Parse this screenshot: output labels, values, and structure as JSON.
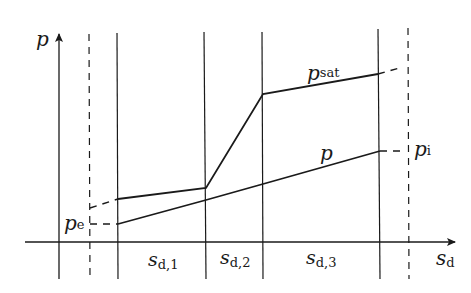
{
  "diagram": {
    "type": "pressure-profile",
    "axes": {
      "y_label": "p",
      "x_label": "s",
      "x_label_sub": "d"
    },
    "curves": {
      "saturation": {
        "label": "p",
        "label_sub": "sat"
      },
      "partial": {
        "label": "p"
      }
    },
    "boundary_labels": {
      "exterior": {
        "label": "p",
        "label_sub": "e"
      },
      "interior": {
        "label": "p",
        "label_sub": "i"
      }
    },
    "layers": [
      {
        "label": "s",
        "label_sub": "d,1"
      },
      {
        "label": "s",
        "label_sub": "d,2"
      },
      {
        "label": "s",
        "label_sub": "d,3"
      }
    ],
    "colors": {
      "line": "#1a1a1a",
      "background": "#ffffff"
    }
  }
}
